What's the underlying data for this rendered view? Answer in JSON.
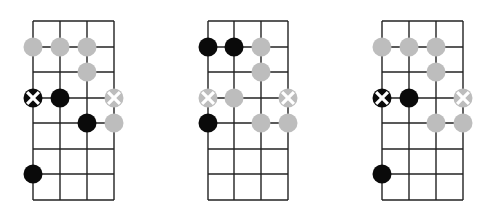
{
  "colors": {
    "background": "#ffffff",
    "grid": "#222222",
    "black_dot": "#0a0a0a",
    "gray_dot": "#bdbdbd",
    "x_mark": "#ffffff"
  },
  "grid": {
    "strings": 4,
    "rows_y": [
      21,
      47,
      72,
      98,
      123,
      149,
      174,
      200
    ],
    "dot_radius": 9.5
  },
  "diagrams": [
    {
      "name": "diagram-1",
      "strings_x": [
        33,
        60,
        87,
        114
      ],
      "dots": [
        {
          "row": 1,
          "string": 0,
          "type": "gray"
        },
        {
          "row": 1,
          "string": 1,
          "type": "gray"
        },
        {
          "row": 1,
          "string": 2,
          "type": "gray"
        },
        {
          "row": 2,
          "string": 2,
          "type": "gray"
        },
        {
          "row": 3,
          "string": 0,
          "type": "black-x"
        },
        {
          "row": 3,
          "string": 1,
          "type": "black"
        },
        {
          "row": 3,
          "string": 3,
          "type": "gray-x"
        },
        {
          "row": 4,
          "string": 2,
          "type": "black"
        },
        {
          "row": 4,
          "string": 3,
          "type": "gray"
        },
        {
          "row": 6,
          "string": 0,
          "type": "black"
        }
      ]
    },
    {
      "name": "diagram-2",
      "strings_x": [
        208,
        234,
        261,
        288
      ],
      "dots": [
        {
          "row": 1,
          "string": 0,
          "type": "black"
        },
        {
          "row": 1,
          "string": 1,
          "type": "black"
        },
        {
          "row": 1,
          "string": 2,
          "type": "gray"
        },
        {
          "row": 2,
          "string": 2,
          "type": "gray"
        },
        {
          "row": 3,
          "string": 0,
          "type": "gray-x"
        },
        {
          "row": 3,
          "string": 1,
          "type": "gray"
        },
        {
          "row": 3,
          "string": 3,
          "type": "gray-x"
        },
        {
          "row": 4,
          "string": 0,
          "type": "black"
        },
        {
          "row": 4,
          "string": 2,
          "type": "gray"
        },
        {
          "row": 4,
          "string": 3,
          "type": "gray"
        }
      ]
    },
    {
      "name": "diagram-3",
      "strings_x": [
        382,
        409,
        436,
        463
      ],
      "dots": [
        {
          "row": 1,
          "string": 0,
          "type": "gray"
        },
        {
          "row": 1,
          "string": 1,
          "type": "gray"
        },
        {
          "row": 1,
          "string": 2,
          "type": "gray"
        },
        {
          "row": 2,
          "string": 2,
          "type": "gray"
        },
        {
          "row": 3,
          "string": 0,
          "type": "black-x"
        },
        {
          "row": 3,
          "string": 1,
          "type": "black"
        },
        {
          "row": 3,
          "string": 3,
          "type": "gray-x"
        },
        {
          "row": 4,
          "string": 2,
          "type": "gray"
        },
        {
          "row": 4,
          "string": 3,
          "type": "gray"
        },
        {
          "row": 6,
          "string": 0,
          "type": "black"
        }
      ]
    }
  ]
}
